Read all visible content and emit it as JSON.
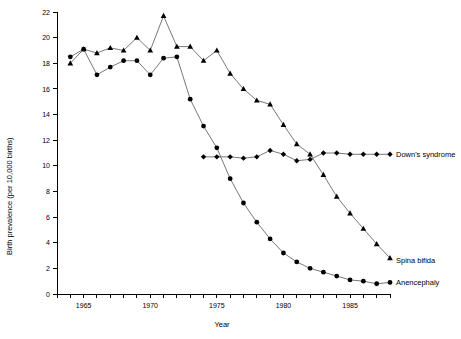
{
  "chart_data": {
    "type": "line",
    "title": "",
    "xlabel": "Year",
    "ylabel": "Birth prevalence (per 10,000 births)",
    "xlim": [
      1963,
      1988
    ],
    "ylim": [
      0,
      22
    ],
    "y_ticks": [
      0,
      2,
      4,
      6,
      8,
      10,
      12,
      14,
      16,
      18,
      20,
      22
    ],
    "y_tick_labels": [
      "0",
      "2",
      "4",
      "6",
      "8",
      "10",
      "12",
      "14",
      "16",
      "18",
      "20",
      "22"
    ],
    "x_ticks": [
      1963,
      1964,
      1965,
      1966,
      1967,
      1968,
      1969,
      1970,
      1971,
      1972,
      1973,
      1974,
      1975,
      1976,
      1977,
      1978,
      1979,
      1980,
      1981,
      1982,
      1983,
      1984,
      1985,
      1986,
      1987,
      1988
    ],
    "x_tick_labels": [
      {
        "year": 1965,
        "label": "1965"
      },
      {
        "year": 1970,
        "label": "1970"
      },
      {
        "year": 1975,
        "label": "1975"
      },
      {
        "year": 1980,
        "label": "1980"
      },
      {
        "year": 1985,
        "label": "1985"
      }
    ],
    "grid": false,
    "legend_position": "right-inline-labels",
    "series": [
      {
        "name": "Spina bifida",
        "label": "Spina bifida",
        "marker": "triangle",
        "label_anchor_year": 1988,
        "label_anchor_value": 2.6,
        "x": [
          1964,
          1965,
          1966,
          1967,
          1968,
          1969,
          1970,
          1971,
          1972,
          1973,
          1974,
          1975,
          1976,
          1977,
          1978,
          1979,
          1980,
          1981,
          1982,
          1983,
          1984,
          1985,
          1986,
          1987,
          1988
        ],
        "values": [
          18.0,
          19.1,
          18.8,
          19.2,
          19.0,
          20.0,
          19.0,
          21.7,
          19.3,
          19.3,
          18.2,
          19.0,
          17.2,
          16.0,
          15.1,
          14.8,
          13.2,
          11.7,
          10.9,
          9.3,
          7.6,
          6.3,
          5.1,
          3.9,
          2.8
        ]
      },
      {
        "name": "Anencephaly",
        "label": "Anencephaly",
        "marker": "circle",
        "label_anchor_year": 1988,
        "label_anchor_value": 0.9,
        "x": [
          1964,
          1965,
          1966,
          1967,
          1968,
          1969,
          1970,
          1971,
          1972,
          1973,
          1974,
          1975,
          1976,
          1977,
          1978,
          1979,
          1980,
          1981,
          1982,
          1983,
          1984,
          1985,
          1986,
          1987,
          1988
        ],
        "values": [
          18.5,
          19.1,
          17.1,
          17.7,
          18.2,
          18.2,
          17.1,
          18.4,
          18.5,
          15.2,
          13.1,
          11.4,
          9.0,
          7.1,
          5.6,
          4.3,
          3.2,
          2.5,
          2.0,
          1.7,
          1.4,
          1.1,
          1.0,
          0.8,
          0.9
        ]
      },
      {
        "name": "Down's syndrome",
        "label": "Down's syndrome",
        "marker": "diamond",
        "label_anchor_year": 1988,
        "label_anchor_value": 10.9,
        "x": [
          1974,
          1975,
          1976,
          1977,
          1978,
          1979,
          1980,
          1981,
          1982,
          1983,
          1984,
          1985,
          1986,
          1987,
          1988
        ],
        "values": [
          10.7,
          10.7,
          10.7,
          10.6,
          10.7,
          11.2,
          10.9,
          10.4,
          10.5,
          11.0,
          11.0,
          10.9,
          10.9,
          10.9,
          10.9
        ]
      }
    ]
  },
  "colors": {
    "marker": "#000000",
    "line": "#555555",
    "axis": "#000000",
    "background": "#ffffff"
  }
}
